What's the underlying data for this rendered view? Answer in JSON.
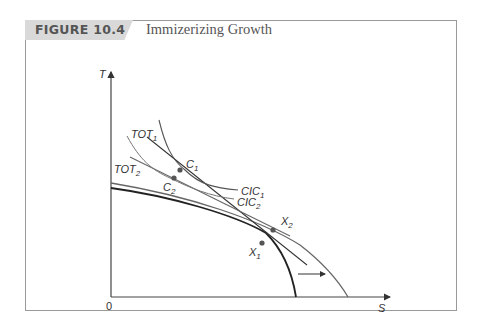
{
  "figure": {
    "tag": "FIGURE 10.4",
    "title": "Immizerizing Growth"
  },
  "axes": {
    "y_label": "T",
    "x_label": "S",
    "origin_label": "0"
  },
  "labels": {
    "tot1": {
      "main": "TOT",
      "sub": "1"
    },
    "tot2": {
      "main": "TOT",
      "sub": "2"
    },
    "c1": {
      "main": "C",
      "sub": "1"
    },
    "c2": {
      "main": "C",
      "sub": "2"
    },
    "cic1": {
      "main": "CIC",
      "sub": "1"
    },
    "cic2": {
      "main": "CIC",
      "sub": "2"
    },
    "x1": {
      "main": "X",
      "sub": "1"
    },
    "x2": {
      "main": "X",
      "sub": "2"
    }
  },
  "colors": {
    "frame": "#9a9a9a",
    "tag_bg": "#d9d9d9",
    "curve_dark": "#222222",
    "curve_gray": "#666666",
    "point": "#555555"
  }
}
